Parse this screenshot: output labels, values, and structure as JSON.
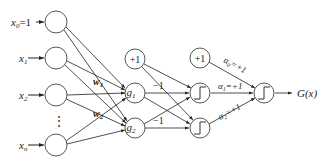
{
  "diagram": {
    "title": "",
    "inputs": [
      {
        "id": "x0",
        "label": "x",
        "sub": "0",
        "suffix": "=1",
        "cx": 56,
        "cy": 22
      },
      {
        "id": "x1",
        "label": "x",
        "sub": "1",
        "suffix": "",
        "cx": 56,
        "cy": 58
      },
      {
        "id": "x2",
        "label": "x",
        "sub": "2",
        "suffix": "",
        "cx": 56,
        "cy": 95
      },
      {
        "id": "xn",
        "label": "x",
        "sub": "n",
        "suffix": "",
        "cx": 56,
        "cy": 145
      }
    ],
    "ellipsis": "⋮",
    "hidden": [
      {
        "id": "bias1",
        "label": "+1",
        "cx": 135,
        "cy": 59
      },
      {
        "id": "g1",
        "label": "g",
        "sub": "1",
        "cx": 135,
        "cy": 93
      },
      {
        "id": "g2",
        "label": "g",
        "sub": "2",
        "cx": 135,
        "cy": 128
      }
    ],
    "threshold": [
      {
        "id": "bias2",
        "label": "+1",
        "cx": 200,
        "cy": 58
      },
      {
        "id": "t1",
        "label": "step",
        "cx": 200,
        "cy": 93
      },
      {
        "id": "t2",
        "label": "step",
        "cx": 200,
        "cy": 128
      }
    ],
    "output": {
      "id": "out",
      "label": "step",
      "cx": 264,
      "cy": 93
    },
    "output_label": "G(x)",
    "weights": {
      "w1": "w",
      "w1_sub": "1",
      "w2": "w",
      "w2_sub": "2",
      "minus1_top": "−1",
      "minus1_bottom": "−1",
      "alpha0": "α",
      "alpha0_sub": "0",
      "alpha0_val": "=+1",
      "alpha1": "α",
      "alpha1_sub": "1",
      "alpha1_val": "=+1",
      "alpha2": "α",
      "alpha2_sub": "2",
      "alpha2_val": "=+1"
    }
  }
}
